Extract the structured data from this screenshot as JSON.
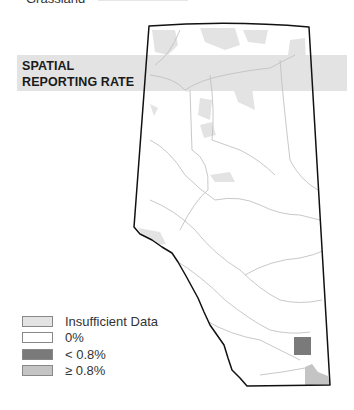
{
  "top_legend_fragment": {
    "label": "Grassland",
    "swatch_color": "#e6e6e6"
  },
  "title": {
    "line1": "SPATIAL",
    "line2": "REPORTING RATE"
  },
  "legend": {
    "items": [
      {
        "label": "Insufficient Data",
        "color": "#e3e3e3"
      },
      {
        "label": "0%",
        "color": "#ffffff"
      },
      {
        "label": "< 0.8%",
        "color": "#7a7a7a"
      },
      {
        "label": "≥ 0.8%",
        "color": "#c4c4c4"
      }
    ]
  },
  "map": {
    "region": "Alberta",
    "border_color": "#111111",
    "river_color": "#bdbdbd",
    "insufficient_color": "#e3e3e3",
    "low_rate_color": "#7a7a7a",
    "high_rate_color": "#c4c4c4"
  }
}
